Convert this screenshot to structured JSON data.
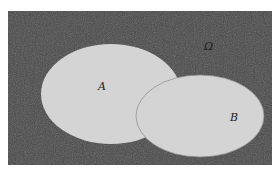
{
  "diagram": {
    "type": "venn",
    "universe": {
      "label": "Ω",
      "x": 8,
      "y": 11,
      "width": 264,
      "height": 154,
      "fill": "#4a4a4a"
    },
    "sets": [
      {
        "id": "A",
        "label": "A",
        "cx": 111,
        "cy": 94,
        "rx": 70,
        "ry": 50,
        "fill": "#d4d4d4"
      },
      {
        "id": "B",
        "label": "B",
        "cx": 200,
        "cy": 116,
        "rx": 64,
        "ry": 41,
        "fill": "#d4d4d4",
        "stroke": "#888888"
      }
    ],
    "label_positions": {
      "omega": {
        "x": 204,
        "y": 50
      },
      "A": {
        "x": 101,
        "y": 90
      },
      "B": {
        "x": 234,
        "y": 121
      }
    }
  }
}
